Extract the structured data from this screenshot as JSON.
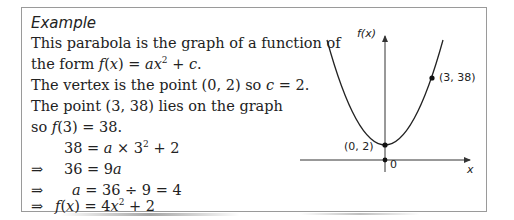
{
  "example": {
    "title": "Example",
    "lines": [
      "This parabola is the graph of a function of",
      "the form f(x) = ax² + c.",
      "The vertex is the point (0, 2) so c = 2.",
      "The point (3, 38) lies on the graph",
      "so f(3) = 38."
    ],
    "working": [
      {
        "arrow": "",
        "expr": "38 = a × 3² + 2"
      },
      {
        "arrow": "⇒",
        "expr": "36 = 9a"
      },
      {
        "arrow": "⇒",
        "expr": "a = 36 ÷ 9 = 4"
      },
      {
        "arrow": "⇒",
        "expr": "f(x) = 4x² + 2"
      }
    ]
  },
  "graph": {
    "y_label": "f(x)",
    "x_label": "x",
    "origin_label": "0",
    "vertex_label": "(0, 2)",
    "point_label": "(3, 38)"
  }
}
